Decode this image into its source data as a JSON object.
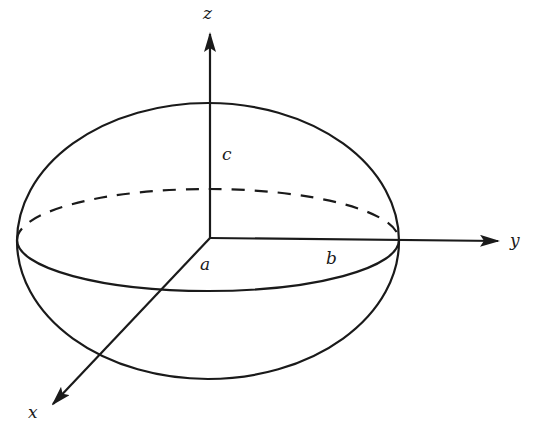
{
  "diagram": {
    "type": "ellipsoid-with-axes",
    "colors": {
      "stroke": "#1a1a1a",
      "background": "#ffffff"
    },
    "axes": {
      "z": {
        "label": "z"
      },
      "y": {
        "label": "y"
      },
      "x": {
        "label": "x"
      }
    },
    "semi_axes": {
      "a": {
        "label": "a"
      },
      "b": {
        "label": "b"
      },
      "c": {
        "label": "c"
      }
    },
    "outline": {
      "style": "solid"
    },
    "equator": {
      "front_style": "solid",
      "back_style": "dashed"
    }
  }
}
